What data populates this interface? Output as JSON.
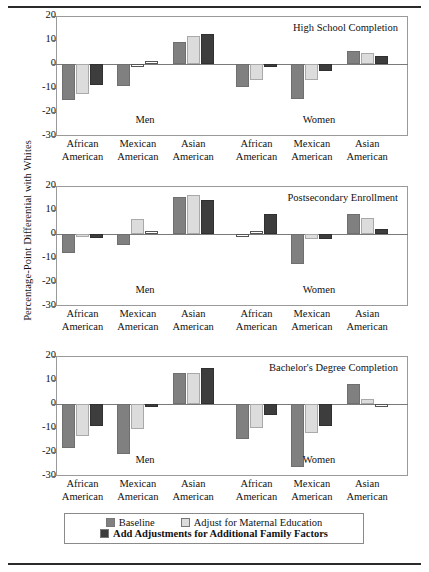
{
  "chart_data": {
    "type": "bar",
    "title": "",
    "ylabel": "Percentage-Point Differential with Whites",
    "xlabel": "",
    "ylim": [
      -30,
      20
    ],
    "yticks": [
      20,
      10,
      0,
      -10,
      -20,
      -30
    ],
    "grid": false,
    "legend_position": "bottom",
    "categories": [
      "African American",
      "Mexican American",
      "Asian American"
    ],
    "group_labels": [
      "Men",
      "Women"
    ],
    "series": [
      {
        "name": "Baseline",
        "color": "#808080"
      },
      {
        "name": "Adjust for Maternal Education",
        "color": "#dcdcdc"
      },
      {
        "name": "Add Adjustments for Additional Family Factors",
        "color": "#3d3d3d"
      }
    ],
    "panels": [
      {
        "title": "High School Completion",
        "groups": [
          {
            "label": "Men",
            "categories": [
              "African American",
              "Mexican American",
              "Asian American"
            ],
            "values": [
              [
                -14.8,
                -12.3,
                -8.8
              ],
              [
                -9.0,
                -0.6,
                0.8
              ],
              [
                9.2,
                11.6,
                12.4
              ]
            ]
          },
          {
            "label": "Women",
            "categories": [
              "African American",
              "Mexican American",
              "Asian American"
            ],
            "values": [
              [
                -9.4,
                -6.6,
                -1.2
              ],
              [
                -14.4,
                -6.8,
                -3.0
              ],
              [
                5.6,
                4.4,
                3.4
              ]
            ]
          }
        ]
      },
      {
        "title": "Postsecondary Enrollment",
        "groups": [
          {
            "label": "Men",
            "categories": [
              "African American",
              "Mexican American",
              "Asian American"
            ],
            "values": [
              [
                -8.0,
                -1.4,
                -1.6
              ],
              [
                -4.6,
                6.4,
                0.0
              ],
              [
                15.6,
                16.2,
                14.0
              ]
            ]
          },
          {
            "label": "Women",
            "categories": [
              "African American",
              "Mexican American",
              "Asian American"
            ],
            "values": [
              [
                -0.6,
                0.4,
                8.4
              ],
              [
                -12.4,
                -2.2,
                -2.0
              ],
              [
                8.2,
                6.8,
                2.2
              ]
            ]
          }
        ]
      },
      {
        "title": "Bachelor's Degree Completion",
        "groups": [
          {
            "label": "Men",
            "categories": [
              "African American",
              "Mexican American",
              "Asian American"
            ],
            "values": [
              [
                -18.4,
                -13.4,
                -9.2
              ],
              [
                -21.0,
                -10.6,
                -1.0
              ],
              [
                12.8,
                13.0,
                15.2
              ]
            ]
          },
          {
            "label": "Women",
            "categories": [
              "African American",
              "Mexican American",
              "Asian American"
            ],
            "values": [
              [
                -14.4,
                -10.0,
                -4.6
              ],
              [
                -26.4,
                -12.0,
                -9.2
              ],
              [
                8.4,
                2.0,
                -0.4
              ]
            ]
          }
        ]
      }
    ]
  },
  "legend": {
    "items": [
      {
        "label": "Baseline",
        "swatch": "#808080"
      },
      {
        "label": "Adjust for Maternal Education",
        "swatch": "#dcdcdc"
      },
      {
        "label": "Add Adjustments for Additional Family Factors",
        "swatch": "#3d3d3d"
      }
    ]
  }
}
